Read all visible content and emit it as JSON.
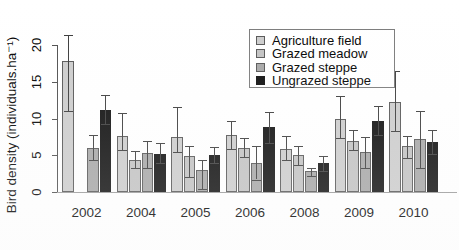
{
  "chart_data": {
    "type": "bar",
    "title": "",
    "subtitle": "",
    "xlabel": "",
    "ylabel": "Bird density (individuals.ha⁻¹)",
    "categories": [
      "2002",
      "2004",
      "2005",
      "2006",
      "2008",
      "2009",
      "2010"
    ],
    "ylim": [
      0,
      21.5
    ],
    "yticks": [
      0,
      5,
      10,
      15,
      20
    ],
    "ytick_labels": [
      "0",
      "5",
      "10",
      "15",
      "20"
    ],
    "grid": false,
    "legend_position": "top-right",
    "error_bars": "whiskers with caps, upper and lower",
    "series": [
      {
        "name": "Agriculture field",
        "color": "#cccccc",
        "values": [
          17.8,
          7.6,
          7.5,
          7.7,
          5.9,
          9.9,
          12.3
        ],
        "err_upper": [
          21.4,
          10.7,
          11.5,
          9.7,
          7.6,
          13.0,
          16.4
        ],
        "err_lower": [
          11.0,
          5.7,
          5.5,
          5.9,
          4.4,
          7.3,
          8.3
        ]
      },
      {
        "name": "Grazed meadow",
        "color": "#c2c2c2",
        "values": [
          null,
          4.3,
          4.9,
          6.0,
          5.0,
          7.0,
          6.2
        ],
        "err_upper": [
          null,
          5.6,
          6.3,
          7.3,
          6.2,
          8.4,
          7.6
        ],
        "err_lower": [
          null,
          3.2,
          2.1,
          4.8,
          3.7,
          5.7,
          4.6
        ]
      },
      {
        "name": "Grazed steppe",
        "color": "#a6a6a6",
        "values": [
          6.0,
          5.3,
          3.0,
          4.0,
          2.8,
          5.5,
          7.2
        ],
        "err_upper": [
          7.7,
          6.9,
          4.3,
          6.3,
          3.3,
          7.5,
          11.0
        ],
        "err_lower": [
          4.3,
          3.3,
          0.4,
          1.7,
          2.2,
          3.3,
          3.2
        ]
      },
      {
        "name": "Ungrazed steppe",
        "color": "#0d0d0d",
        "values": [
          11.2,
          5.2,
          5.0,
          8.8,
          3.9,
          9.7,
          6.8
        ],
        "err_upper": [
          13.2,
          6.6,
          6.1,
          10.9,
          4.9,
          11.7,
          8.4
        ],
        "err_lower": [
          9.3,
          3.9,
          4.0,
          6.6,
          2.9,
          7.7,
          5.2
        ]
      }
    ],
    "legend_entries": [
      "Agriculture field",
      "Grazed meadow",
      "Grazed steppe",
      "Ungrazed steppe"
    ],
    "colors": {
      "agriculture_field": "#cccccc",
      "grazed_meadow": "#c2c2c2",
      "grazed_steppe": "#a6a6a6",
      "ungrazed_steppe": "#0d0d0d",
      "axis": "#4d4d4d",
      "text": "#000000",
      "background": "#ffffff"
    }
  }
}
